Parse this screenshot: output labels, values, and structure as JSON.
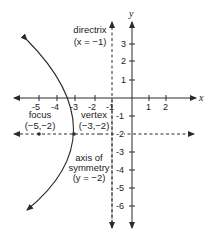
{
  "diagram": {
    "axes": {
      "x_label": "x",
      "y_label": "y"
    },
    "x_ticks": [
      "-5",
      "-4",
      "-3",
      "-2",
      "-1",
      "1",
      "2"
    ],
    "y_ticks": [
      "3",
      "2",
      "1",
      "-1",
      "-2",
      "-3",
      "-4",
      "-5",
      "-6"
    ],
    "labels": {
      "directrix_name": "directrix",
      "directrix_eq": "(x = −1)",
      "focus_name": "focus",
      "focus_coords": "(−5,−2)",
      "vertex_name": "vertex",
      "vertex_coords": "(−3,−2)",
      "axis_name_1": "axis of",
      "axis_name_2": "symmetry",
      "axis_eq": "(y = −2)"
    },
    "colors": {
      "line": "#2a2a2a",
      "text": "#222222"
    }
  }
}
